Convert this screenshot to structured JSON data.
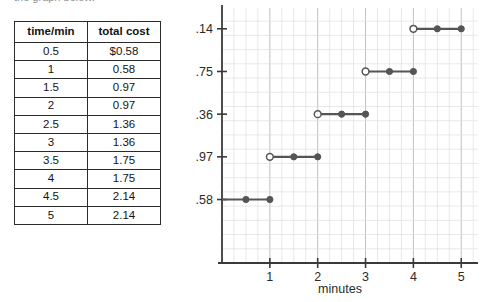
{
  "clipped_heading": "the graph below.",
  "table": {
    "columns": [
      "time/min",
      "total cost"
    ],
    "rows": [
      [
        "0.5",
        "$0.58"
      ],
      [
        "1",
        "0.58"
      ],
      [
        "1.5",
        "0.97"
      ],
      [
        "2",
        "0.97"
      ],
      [
        "2.5",
        "1.36"
      ],
      [
        "3",
        "1.36"
      ],
      [
        "3.5",
        "1.75"
      ],
      [
        "4",
        "1.75"
      ],
      [
        "4.5",
        "2.14"
      ],
      [
        "5",
        "2.14"
      ]
    ]
  },
  "chart_data": {
    "type": "line",
    "title": "",
    "xlabel": "minutes",
    "ylabel": "",
    "xlim": [
      0,
      5.35
    ],
    "ylim": [
      0,
      2.33
    ],
    "grid": true,
    "legend": null,
    "xticks": [
      "1",
      "2",
      "3",
      "4",
      "5"
    ],
    "xtick_values": [
      1,
      2,
      3,
      4,
      5
    ],
    "yticks": [
      "0.58",
      "0.97",
      "1.36",
      "1.75",
      "2.14"
    ],
    "ytick_values": [
      0.58,
      0.97,
      1.36,
      1.75,
      2.14
    ],
    "x_minor_step": 0.25,
    "y_minor_step": 0.13,
    "series_color": "#555555",
    "segments": [
      {
        "y": 0.58,
        "x_start": 0,
        "x_end": 1,
        "left_marker": "none",
        "mid_x": 0.5,
        "right_marker": "closed"
      },
      {
        "y": 0.97,
        "x_start": 1,
        "x_end": 2,
        "left_marker": "open",
        "mid_x": 1.5,
        "right_marker": "closed"
      },
      {
        "y": 1.36,
        "x_start": 2,
        "x_end": 3,
        "left_marker": "open",
        "mid_x": 2.5,
        "right_marker": "closed"
      },
      {
        "y": 1.75,
        "x_start": 3,
        "x_end": 4,
        "left_marker": "open",
        "mid_x": 3.5,
        "right_marker": "closed"
      },
      {
        "y": 2.14,
        "x_start": 4,
        "x_end": 5,
        "left_marker": "open",
        "mid_x": 4.5,
        "right_marker": "closed"
      }
    ],
    "points": [
      {
        "x": 0.5,
        "y": 0.58,
        "marker": "closed"
      },
      {
        "x": 1.0,
        "y": 0.58,
        "marker": "closed"
      },
      {
        "x": 1.0,
        "y": 0.97,
        "marker": "open"
      },
      {
        "x": 1.5,
        "y": 0.97,
        "marker": "closed"
      },
      {
        "x": 2.0,
        "y": 0.97,
        "marker": "closed"
      },
      {
        "x": 2.0,
        "y": 1.36,
        "marker": "open"
      },
      {
        "x": 2.5,
        "y": 1.36,
        "marker": "closed"
      },
      {
        "x": 3.0,
        "y": 1.36,
        "marker": "closed"
      },
      {
        "x": 3.0,
        "y": 1.75,
        "marker": "open"
      },
      {
        "x": 3.5,
        "y": 1.75,
        "marker": "closed"
      },
      {
        "x": 4.0,
        "y": 1.75,
        "marker": "closed"
      },
      {
        "x": 4.0,
        "y": 2.14,
        "marker": "open"
      },
      {
        "x": 4.5,
        "y": 2.14,
        "marker": "closed"
      },
      {
        "x": 5.0,
        "y": 2.14,
        "marker": "closed"
      }
    ]
  }
}
